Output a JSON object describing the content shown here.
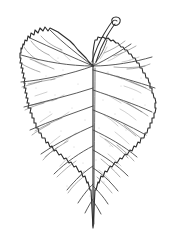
{
  "image": {
    "title": "Botanical line drawing of a leaf",
    "subject": "leaf",
    "style": "ink line drawing / botanical illustration",
    "width_px": 173,
    "height_px": 234,
    "background_color": "#ffffff",
    "ink_color": "#2b2b2b",
    "vein_color": "#5a5a5a",
    "speckle_color": "#9a9a9a"
  },
  "specimen": {
    "blade_shape": "cordate (heart-shaped)",
    "apex": "acuminate (drawn pointing downward)",
    "base": "cordate with deep notch at petiole",
    "margin": "serrate (finely toothed)",
    "venation": "palmate at base grading to pinnate along midrib",
    "petiole": "curved, hooked at free end, attached at top of blade",
    "orientation": "apex down, petiole up",
    "surface_texture": "lightly speckled"
  },
  "geometry": {
    "blade_left_extent_px": 20,
    "blade_right_extent_px": 156,
    "blade_top_extent_px": 25,
    "blade_apex_y_px": 228,
    "vein_origin_x_px": 93,
    "vein_origin_y_px": 66,
    "petiole_tip_x_px": 113,
    "petiole_tip_y_px": 20,
    "primary_vein_count": 12,
    "serration_count": 76
  },
  "labels": {
    "figure_caption": "",
    "scale_bar": "",
    "annotations": []
  }
}
